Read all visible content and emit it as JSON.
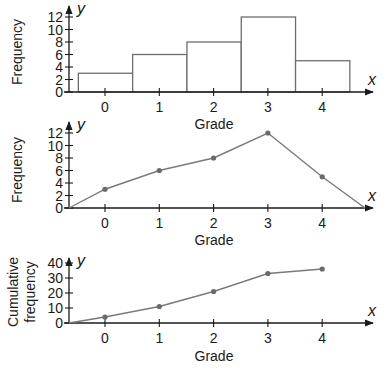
{
  "chart_data": [
    {
      "type": "bar",
      "subtype": "histogram",
      "categories": [
        "0",
        "1",
        "2",
        "3",
        "4"
      ],
      "values": [
        3,
        6,
        8,
        12,
        5
      ],
      "xlabel": "Grade",
      "ylabel": "Frequency",
      "x_var": "x",
      "y_var": "y",
      "yticks": [
        "0",
        "2",
        "4",
        "6",
        "8",
        "10",
        "12"
      ],
      "ylim": [
        0,
        12
      ],
      "grid": false,
      "legend": null
    },
    {
      "type": "line",
      "subtype": "frequency polygon",
      "categories": [
        "0",
        "1",
        "2",
        "3",
        "4"
      ],
      "values": [
        3,
        6,
        8,
        12,
        5
      ],
      "endpoints": {
        "start": 0,
        "end": 0
      },
      "xlabel": "Grade",
      "ylabel": "Frequency",
      "x_var": "x",
      "y_var": "y",
      "yticks": [
        "0",
        "2",
        "4",
        "6",
        "8",
        "10",
        "12"
      ],
      "ylim": [
        0,
        12
      ],
      "grid": false,
      "legend": null
    },
    {
      "type": "line",
      "subtype": "cumulative frequency (ogive)",
      "categories": [
        "0",
        "1",
        "2",
        "3",
        "4"
      ],
      "values": [
        4,
        11,
        21,
        33,
        36
      ],
      "start": 0,
      "xlabel": "Grade",
      "ylabel": "Cumulative frequency",
      "x_var": "x",
      "y_var": "y",
      "yticks": [
        "0",
        "10",
        "20",
        "30",
        "40"
      ],
      "ylim": [
        0,
        40
      ],
      "grid": false,
      "legend": null
    }
  ],
  "labels": {
    "chart1": {
      "ylabel": "Frequency",
      "xlabel": "Grade",
      "x_var": "x",
      "y_var": "y",
      "yticks": [
        "0",
        "2",
        "4",
        "6",
        "8",
        "10",
        "12"
      ],
      "xticks": [
        "0",
        "1",
        "2",
        "3",
        "4"
      ]
    },
    "chart2": {
      "ylabel": "Frequency",
      "xlabel": "Grade",
      "x_var": "x",
      "y_var": "y",
      "yticks": [
        "0",
        "2",
        "4",
        "6",
        "8",
        "10",
        "12"
      ],
      "xticks": [
        "0",
        "1",
        "2",
        "3",
        "4"
      ]
    },
    "chart3": {
      "ylabel_line1": "Cumulative",
      "ylabel_line2": "frequency",
      "xlabel": "Grade",
      "x_var": "x",
      "y_var": "y",
      "yticks": [
        "0",
        "10",
        "20",
        "30",
        "40"
      ],
      "xticks": [
        "0",
        "1",
        "2",
        "3",
        "4"
      ]
    }
  },
  "colors": {
    "axis": "#1a1a1a",
    "bar_stroke": "#6e6e6e",
    "line": "#7a7a7a",
    "point": "#6a6a6a"
  }
}
